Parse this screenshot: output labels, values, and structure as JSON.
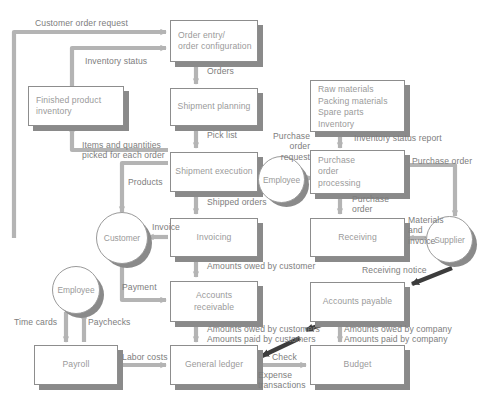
{
  "diagram": {
    "colors": {
      "box_fill": "#ffffff",
      "box_border": "#8d8d8d",
      "shadow": "#8a8a8a",
      "arrow": "#b4b4b4",
      "arrow_dark": "#3c3c3c",
      "text": "#9a9a9a",
      "label_text": "#7d7d7d"
    },
    "nodes": [
      {
        "id": "order_entry",
        "label": "Order entry/\norder configuration",
        "shape": "box"
      },
      {
        "id": "shipment_planning",
        "label": "Shipment planning",
        "shape": "box"
      },
      {
        "id": "shipment_execution",
        "label": "Shipment execution",
        "shape": "box"
      },
      {
        "id": "invoicing",
        "label": "Invoicing",
        "shape": "box"
      },
      {
        "id": "accounts_receivable",
        "label": "Accounts\nreceivable",
        "shape": "box"
      },
      {
        "id": "general_ledger",
        "label": "General ledger",
        "shape": "box"
      },
      {
        "id": "finished_product",
        "label": "Finished product\ninventory",
        "shape": "box"
      },
      {
        "id": "payroll",
        "label": "Payroll",
        "shape": "box"
      },
      {
        "id": "materials",
        "label": "Raw materials\nPacking materials\nSpare parts\nInventory",
        "shape": "box"
      },
      {
        "id": "po_processing",
        "label": "Purchase\norder\nprocessing",
        "shape": "box"
      },
      {
        "id": "receiving",
        "label": "Receiving",
        "shape": "box"
      },
      {
        "id": "accounts_payable",
        "label": "Accounts payable",
        "shape": "box"
      },
      {
        "id": "budget",
        "label": "Budget",
        "shape": "box"
      },
      {
        "id": "customer",
        "label": "Customer",
        "shape": "circle"
      },
      {
        "id": "employee_payroll",
        "label": "Employee",
        "shape": "circle"
      },
      {
        "id": "employee_purchase",
        "label": "Employee",
        "shape": "circle"
      },
      {
        "id": "supplier",
        "label": "Supplier",
        "shape": "circle"
      }
    ],
    "flows": [
      {
        "id": "customer_order_request",
        "label": "Customer order request"
      },
      {
        "id": "inventory_status",
        "label": "Inventory status"
      },
      {
        "id": "orders",
        "label": "Orders"
      },
      {
        "id": "pick_list",
        "label": "Pick list"
      },
      {
        "id": "items_quantities",
        "label": "Items and quantities\npicked for each order"
      },
      {
        "id": "products",
        "label": "Products"
      },
      {
        "id": "shipped_orders",
        "label": "Shipped orders"
      },
      {
        "id": "invoice",
        "label": "Invoice"
      },
      {
        "id": "amounts_owed_customer",
        "label": "Amounts owed by customer"
      },
      {
        "id": "payment",
        "label": "Payment"
      },
      {
        "id": "amounts_owed_customers",
        "label": "Amounts owed by customers"
      },
      {
        "id": "amounts_paid_customers",
        "label": "Amounts paid by customers"
      },
      {
        "id": "time_cards",
        "label": "Time cards"
      },
      {
        "id": "paychecks",
        "label": "Paychecks"
      },
      {
        "id": "labor_costs",
        "label": "Labor costs"
      },
      {
        "id": "inventory_status_report",
        "label": "Inventory status report"
      },
      {
        "id": "purchase_order_request",
        "label": "Purchase\norder\nrequest"
      },
      {
        "id": "purchase_order_right",
        "label": "Purchase order"
      },
      {
        "id": "purchase_order_down",
        "label": "Purchase\norder"
      },
      {
        "id": "materials_and_invoice",
        "label": "Materials\nand\ninvoice"
      },
      {
        "id": "receiving_notice",
        "label": "Receiving notice"
      },
      {
        "id": "amounts_owed_company",
        "label": "Amounts owed by company"
      },
      {
        "id": "amounts_paid_company",
        "label": "Amounts paid by company"
      },
      {
        "id": "check",
        "label": "Check"
      },
      {
        "id": "expense_transactions",
        "label": "Expense\ntransactions"
      }
    ]
  }
}
